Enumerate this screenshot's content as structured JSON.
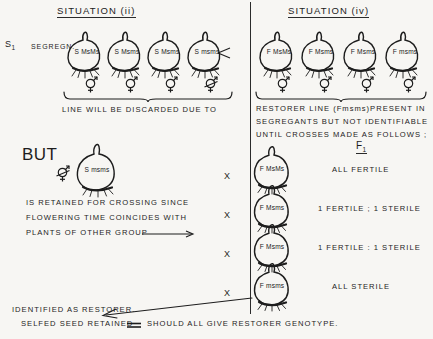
{
  "diagram": {
    "title_left": "SITUATION (ii)",
    "title_right": "SITUATION (iv)",
    "stage_label": "S",
    "stage_label_sub": "1",
    "stage_note": "SEGREGN.",
    "f1_label": "F",
    "f1_label_sub": "1"
  },
  "left_panel": {
    "onions": [
      {
        "prefix": "S",
        "genotype": "MsMs",
        "symbol": "hermaphrodite-symbol",
        "sterile": false
      },
      {
        "prefix": "S",
        "genotype": "Msms",
        "symbol": "hermaphrodite-symbol",
        "sterile": false
      },
      {
        "prefix": "S",
        "genotype": "Msms",
        "symbol": "hermaphrodite-symbol",
        "sterile": false
      },
      {
        "prefix": "S",
        "genotype": "msms",
        "symbol": "hermaphrodite-symbol-struck",
        "sterile": true
      }
    ],
    "brace_caption": "LINE  WILL  BE   DISCARDED   DUE  TO",
    "but_label": "BUT",
    "but_onion": {
      "prefix": "S",
      "genotype": "msms",
      "symbol": "hermaphrodite-symbol-struck",
      "sterile": true
    },
    "but_caption_lines": [
      "IS  RETAINED  FOR  CROSSING  SINCE",
      "FLOWERING   TIME  COINCIDES WITH",
      "PLANTS  OF   OTHER  GROUP"
    ]
  },
  "right_panel": {
    "onions": [
      {
        "prefix": "F",
        "genotype": "MsMs",
        "symbol": "hermaphrodite-symbol",
        "sterile": false
      },
      {
        "prefix": "F",
        "genotype": "Msms",
        "symbol": "hermaphrodite-symbol",
        "sterile": false
      },
      {
        "prefix": "F",
        "genotype": "Msms",
        "symbol": "hermaphrodite-symbol",
        "sterile": false
      },
      {
        "prefix": "F",
        "genotype": "msms",
        "symbol": "hermaphrodite-symbol",
        "sterile": false
      }
    ],
    "brace_caption_lines": [
      "RESTORER  LINE  (Fmsms)PRESENT   IN",
      "SEGREGANTS   BUT  NOT  IDENTIFIABLE",
      "UNTIL  CROSSES   MADE  AS  FOLLOWS ;"
    ],
    "cross_rows": [
      {
        "cross_mark": "X",
        "prefix": "F",
        "genotype": "MsMs",
        "result": "ALL   FERTILE"
      },
      {
        "cross_mark": "X",
        "prefix": "F",
        "genotype": "Msms",
        "result": "1 FERTILE ; 1 STERILE"
      },
      {
        "cross_mark": "X",
        "prefix": "F",
        "genotype": "Msms",
        "result": "1 FERTILE : 1 STERILE"
      },
      {
        "cross_mark": "X",
        "prefix": "F",
        "genotype": "msms",
        "result": "ALL   STERILE"
      }
    ]
  },
  "footer": {
    "line1": "IDENTIFIED  AS  RESTORER.",
    "line2": "SELFED  SEED  RETAINED",
    "line3": "SHOULD  ALL  GIVE  RESTORER  GENOTYPE."
  },
  "colors": {
    "ink": "#1d1d1d",
    "background": "#f7f6f3"
  }
}
